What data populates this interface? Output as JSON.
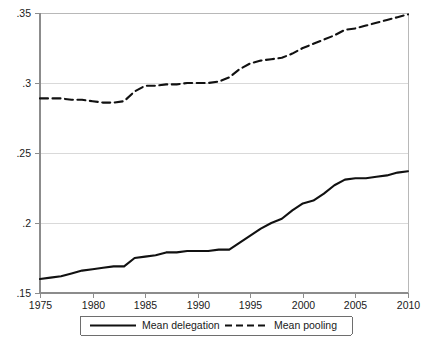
{
  "chart_data": {
    "type": "line",
    "title": "",
    "subtitle": "",
    "xlabel": "",
    "ylabel": "",
    "xlim": [
      1975,
      2010
    ],
    "ylim": [
      0.15,
      0.35
    ],
    "grid": true,
    "grid_axis": "y",
    "legend_position": "bottom-outside",
    "x_tick_labels": [
      "1975",
      "1980",
      "1985",
      "1990",
      "1995",
      "2000",
      "2005",
      "2010"
    ],
    "x_ticks": [
      1975,
      1980,
      1985,
      1990,
      1995,
      2000,
      2005,
      2010
    ],
    "y_tick_labels": [
      ".15",
      ".2",
      ".25",
      ".3",
      ".35"
    ],
    "y_ticks": [
      0.15,
      0.2,
      0.25,
      0.3,
      0.35
    ],
    "x": [
      1975,
      1976,
      1977,
      1978,
      1979,
      1980,
      1981,
      1982,
      1983,
      1984,
      1985,
      1986,
      1987,
      1988,
      1989,
      1990,
      1991,
      1992,
      1993,
      1994,
      1995,
      1996,
      1997,
      1998,
      1999,
      2000,
      2001,
      2002,
      2003,
      2004,
      2005,
      2006,
      2007,
      2008,
      2009,
      2010
    ],
    "series": [
      {
        "name": "Mean delegation",
        "style": "solid",
        "color": "#111111",
        "values": [
          0.16,
          0.161,
          0.162,
          0.164,
          0.166,
          0.167,
          0.168,
          0.169,
          0.169,
          0.175,
          0.176,
          0.177,
          0.179,
          0.179,
          0.18,
          0.18,
          0.18,
          0.181,
          0.181,
          0.186,
          0.191,
          0.196,
          0.2,
          0.203,
          0.209,
          0.214,
          0.216,
          0.221,
          0.227,
          0.231,
          0.232,
          0.232,
          0.233,
          0.234,
          0.236,
          0.237
        ]
      },
      {
        "name": "Mean pooling",
        "style": "dashed",
        "color": "#111111",
        "values": [
          0.289,
          0.289,
          0.289,
          0.288,
          0.288,
          0.287,
          0.286,
          0.286,
          0.287,
          0.294,
          0.298,
          0.298,
          0.299,
          0.299,
          0.3,
          0.3,
          0.3,
          0.301,
          0.304,
          0.31,
          0.314,
          0.316,
          0.317,
          0.318,
          0.321,
          0.325,
          0.328,
          0.331,
          0.334,
          0.338,
          0.339,
          0.341,
          0.343,
          0.345,
          0.347,
          0.349
        ]
      }
    ]
  },
  "legend": {
    "entries": [
      {
        "label": "Mean delegation",
        "style": "solid"
      },
      {
        "label": "Mean pooling",
        "style": "dashed"
      }
    ]
  },
  "caption": {
    "text": ""
  }
}
